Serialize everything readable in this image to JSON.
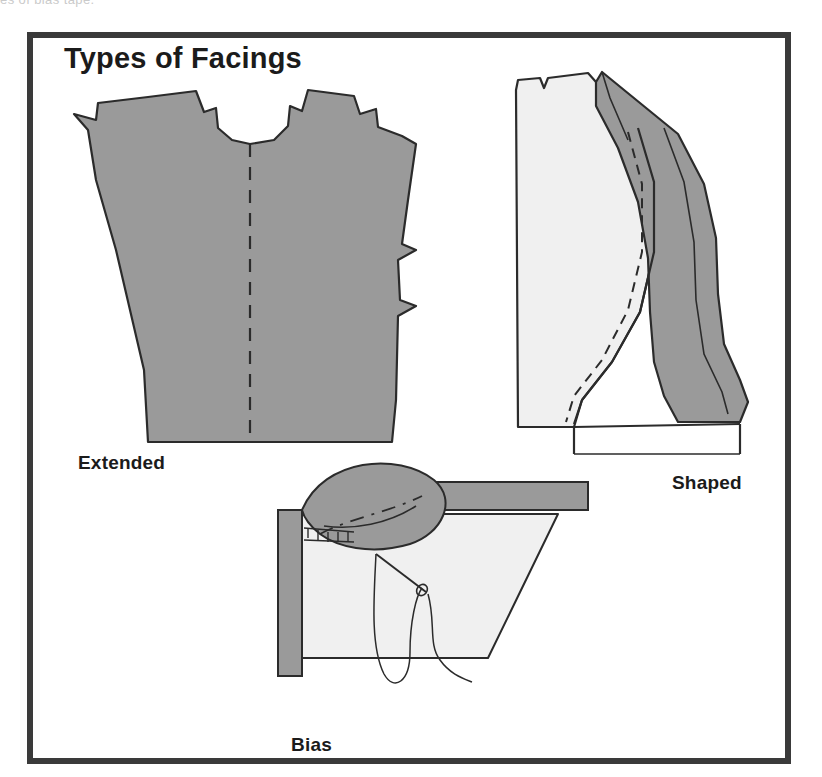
{
  "page": {
    "scan_top_fragment": "es of bias tape."
  },
  "figure": {
    "title": "Types of Facings",
    "frame_color": "#3a3a3a",
    "background_color": "#ffffff",
    "fabric_dark_gray": "#9a9a9a",
    "fabric_light_gray": "#f0f0f0",
    "outline_color": "#2b2b2b",
    "panels": [
      {
        "id": "extended",
        "label": "Extended",
        "icon": "bodice-pattern-piece-icon",
        "description": "Flat bodice front pattern piece shaded dark gray with notches at shoulders and neckline and a dashed center-front fold line."
      },
      {
        "id": "shaped",
        "label": "Shaped",
        "icon": "shaped-facing-icon",
        "description": "Light gray bodice front with a dark gray shaped armhole facing strip stitched around the curve, shown with solid and dashed stitching lines."
      },
      {
        "id": "bias",
        "label": "Bias",
        "icon": "bias-facing-needle-icon",
        "description": "Corner of a light gray garment with a dark gray bias strip folded over the edge, being hand stitched with a threaded needle."
      }
    ]
  }
}
